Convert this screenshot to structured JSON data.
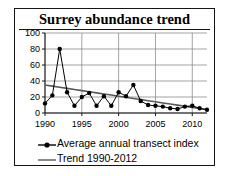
{
  "figure": {
    "title": "Surrey abundance trend",
    "border_color": "#141414",
    "background": "#ffffff"
  },
  "legend": {
    "position": "bottom-left",
    "items": [
      {
        "label": "Average annual transect index",
        "key": "line-marker-key",
        "color": "#000000"
      },
      {
        "label": "Trend 1990-2012",
        "key": "line-key",
        "color": "#595959"
      }
    ]
  },
  "chart_data": {
    "type": "line",
    "title": "Surrey abundance trend",
    "xlabel": "",
    "ylabel": "",
    "xlim": [
      1990,
      2012
    ],
    "ylim": [
      0,
      100
    ],
    "grid": true,
    "ytick_labels": [
      "0",
      "20",
      "40",
      "60",
      "80",
      "100"
    ],
    "yticks": [
      0,
      20,
      40,
      60,
      80,
      100
    ],
    "xtick_labels": [
      "1990",
      "1995",
      "2000",
      "2005",
      "2010"
    ],
    "xticks": [
      1990,
      1995,
      2000,
      2005,
      2010
    ],
    "x": [
      1990,
      1991,
      1992,
      1993,
      1994,
      1995,
      1996,
      1997,
      1998,
      1999,
      2000,
      2001,
      2002,
      2003,
      2004,
      2005,
      2006,
      2007,
      2008,
      2009,
      2010,
      2011,
      2012
    ],
    "series": [
      {
        "name": "Average annual transect index",
        "color": "#000000",
        "marker": "circle",
        "values": [
          12,
          22,
          80,
          26,
          9,
          20,
          25,
          9,
          21,
          9,
          26,
          21,
          35,
          15,
          10,
          9,
          8,
          6,
          5,
          8,
          9,
          6,
          4
        ]
      },
      {
        "name": "Trend 1990-2012",
        "color": "#595959",
        "marker": "none",
        "values": [
          35,
          33.6,
          32.2,
          30.8,
          29.4,
          28,
          26.6,
          25.2,
          23.8,
          22.4,
          21,
          19.6,
          18.2,
          16.8,
          15.4,
          14,
          12.6,
          11.2,
          9.8,
          8.4,
          7,
          5.6,
          4
        ]
      }
    ]
  }
}
